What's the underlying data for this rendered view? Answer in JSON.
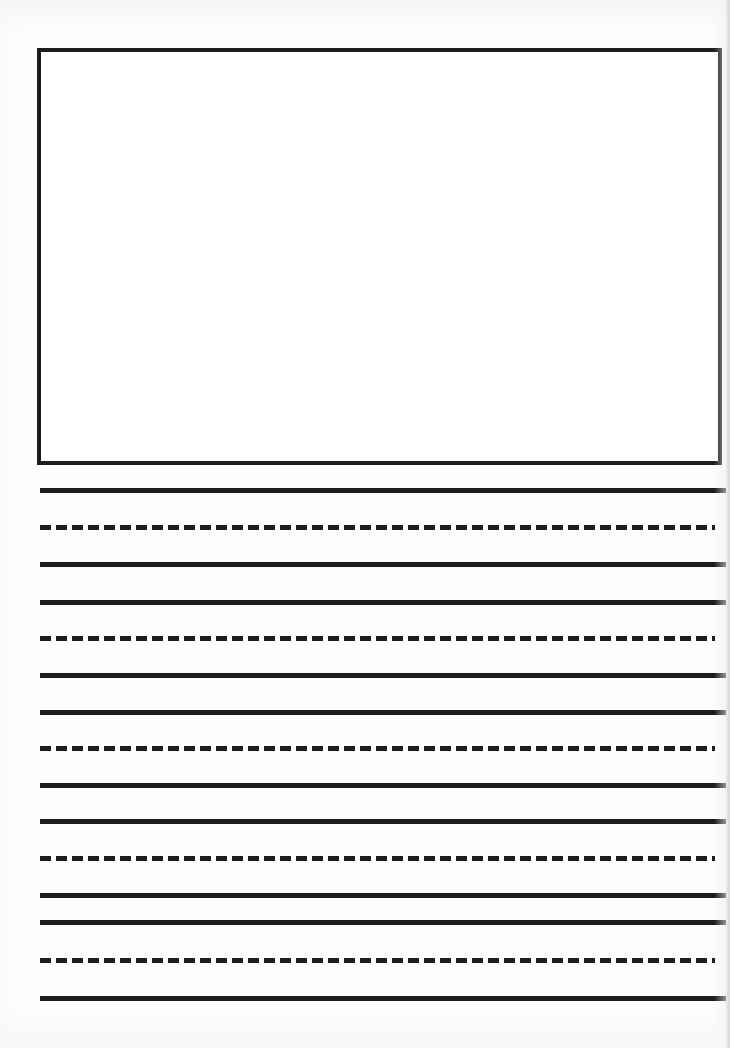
{
  "document": {
    "type": "primary-handwriting-practice-worksheet",
    "orientation": "portrait",
    "page_width_px": 730,
    "page_height_px": 1048,
    "background_color": "#fdfdfd",
    "ink_color": "#1d1d1d",
    "title_text": "",
    "instructions_text": "",
    "header_text": "",
    "footer_text": "",
    "page_number_text": ""
  },
  "drawing_box": {
    "label": "",
    "placeholder_text": "",
    "x": 37,
    "y": 48,
    "width": 685,
    "height": 417,
    "border_width_px": 4,
    "border_color": "#1d1d1d",
    "fill_color": "#ffffff",
    "is_empty": true
  },
  "writing_area": {
    "left_margin_px": 40,
    "right_edge_px": 726,
    "solid_line_width_px": 686,
    "dashed_line_width_px": 675,
    "line_thickness_px": 5,
    "dash_length_px": 11,
    "dash_gap_px": 5,
    "group_count": 4,
    "group_pattern": [
      "solid",
      "dashed",
      "solid"
    ],
    "total_line_count": 15,
    "lines": [
      {
        "index": 1,
        "style": "solid",
        "role": "top-line",
        "y": 488
      },
      {
        "index": 2,
        "style": "dashed",
        "role": "midline",
        "y": 525
      },
      {
        "index": 3,
        "style": "solid",
        "role": "baseline",
        "y": 562
      },
      {
        "index": 4,
        "style": "solid",
        "role": "top-line",
        "y": 600
      },
      {
        "index": 5,
        "style": "dashed",
        "role": "midline",
        "y": 636
      },
      {
        "index": 6,
        "style": "solid",
        "role": "baseline",
        "y": 673
      },
      {
        "index": 7,
        "style": "solid",
        "role": "top-line",
        "y": 710
      },
      {
        "index": 8,
        "style": "dashed",
        "role": "midline",
        "y": 746
      },
      {
        "index": 9,
        "style": "solid",
        "role": "baseline",
        "y": 783
      },
      {
        "index": 10,
        "style": "solid",
        "role": "top-line",
        "y": 819
      },
      {
        "index": 11,
        "style": "dashed",
        "role": "midline",
        "y": 856
      },
      {
        "index": 12,
        "style": "solid",
        "role": "baseline",
        "y": 893
      },
      {
        "index": 13,
        "style": "solid",
        "role": "top-line",
        "y": 920
      },
      {
        "index": 14,
        "style": "dashed",
        "role": "midline",
        "y": 958
      },
      {
        "index": 15,
        "style": "solid",
        "role": "baseline",
        "y": 996
      }
    ]
  }
}
